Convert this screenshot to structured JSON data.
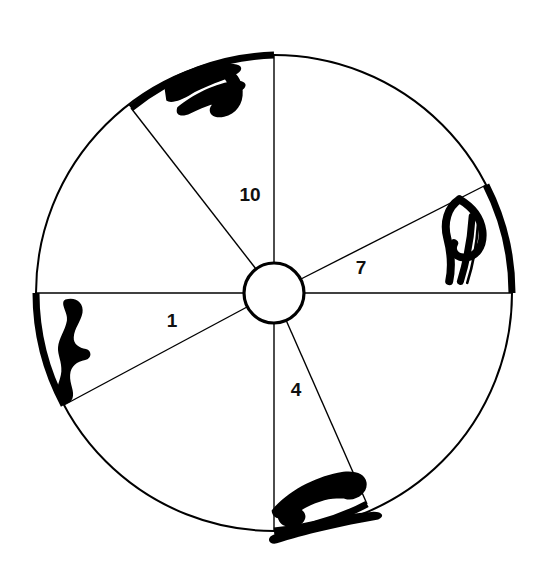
{
  "figure": {
    "kind": "astrological-chart-wheel",
    "background_color": "#ffffff",
    "ink_color": "#000000",
    "outer_circle": {
      "cx": 274,
      "cy": 293,
      "r": 238,
      "stroke_width": 2
    },
    "inner_hub": {
      "cx": 274,
      "cy": 293,
      "r": 30,
      "stroke_width": 3
    }
  },
  "houses": [
    {
      "id": "house-1",
      "label": "1",
      "x": 172,
      "y": 322
    },
    {
      "id": "house-4",
      "label": "4",
      "x": 296,
      "y": 391
    },
    {
      "id": "house-7",
      "label": "7",
      "x": 361,
      "y": 269
    },
    {
      "id": "house-10",
      "label": "10",
      "x": 250,
      "y": 196
    }
  ],
  "spokes": [
    {
      "id": "spoke-asc",
      "angle_deg": 180,
      "thin": true
    },
    {
      "id": "spoke-desc",
      "angle_deg": 0,
      "thin": true
    },
    {
      "id": "spoke-mc",
      "angle_deg": 90,
      "thin": true
    },
    {
      "id": "spoke-ic",
      "angle_deg": 270,
      "thin": true
    },
    {
      "id": "spoke-cusp-11",
      "angle_deg": 127,
      "thin": true
    },
    {
      "id": "spoke-cusp-8",
      "angle_deg": 27,
      "thin": true
    },
    {
      "id": "spoke-cusp-2",
      "angle_deg": 208,
      "thin": true
    },
    {
      "id": "spoke-cusp-5",
      "angle_deg": 293,
      "thin": true
    }
  ],
  "signs": [
    {
      "id": "sign-capricorn",
      "name": "capricorn",
      "symbol": "♑",
      "label": "Capricorn",
      "arc_start_deg": 90,
      "arc_end_deg": 127,
      "glyph_x": 213,
      "glyph_y": 88,
      "position": "top"
    },
    {
      "id": "sign-aries",
      "name": "aries",
      "symbol": "♈",
      "label": "Aries",
      "arc_start_deg": 0,
      "arc_end_deg": 27,
      "glyph_x": 468,
      "glyph_y": 236,
      "position": "right"
    },
    {
      "id": "sign-libra",
      "name": "libra",
      "symbol": "♎",
      "label": "Libra",
      "arc_start_deg": 180,
      "arc_end_deg": 208,
      "glyph_x": 70,
      "glyph_y": 348,
      "position": "left"
    },
    {
      "id": "sign-cancer",
      "name": "cancer",
      "symbol": "♋",
      "label": "Cancer",
      "arc_start_deg": 270,
      "arc_end_deg": 293,
      "glyph_x": 326,
      "glyph_y": 497,
      "position": "bottom"
    }
  ]
}
